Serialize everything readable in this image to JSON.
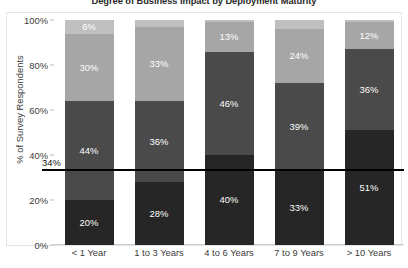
{
  "chart_data": {
    "type": "bar",
    "subtype": "stacked-bar-100",
    "title": "Degree of Business Impact by Deployment Maturity",
    "xlabel": "",
    "ylabel": "% of Survey Respondents",
    "ylim": [
      0,
      100
    ],
    "y_ticks": [
      "0%",
      "20%",
      "40%",
      "60%",
      "80%",
      "100%"
    ],
    "y_tick_values": [
      0,
      20,
      40,
      60,
      80,
      100
    ],
    "grid": false,
    "legend": "none",
    "categories": [
      "< 1 Year",
      "1 to 3 Years",
      "4 to 6 Years",
      "7 to 9 Years",
      "> 10 Years"
    ],
    "series": [
      {
        "name": "Level 1",
        "color": "#262626",
        "values": [
          20,
          28,
          40,
          33,
          51
        ],
        "labels": [
          "20%",
          "28%",
          "40%",
          "33%",
          "51%"
        ]
      },
      {
        "name": "Level 2",
        "color": "#4a4a4a",
        "values": [
          44,
          36,
          46,
          39,
          36
        ],
        "labels": [
          "44%",
          "36%",
          "46%",
          "39%",
          "36%"
        ]
      },
      {
        "name": "Level 3",
        "color": "#a6a6a6",
        "values": [
          30,
          33,
          13,
          24,
          12
        ],
        "labels": [
          "30%",
          "33%",
          "13%",
          "24%",
          "12%"
        ]
      },
      {
        "name": "Level 4",
        "color": "#bfbfbf",
        "values": [
          6,
          3,
          1,
          4,
          1
        ],
        "labels": [
          "6%",
          "",
          "",
          "",
          ""
        ]
      }
    ],
    "annotations": [
      {
        "type": "horizontal-reference-line",
        "value": 34,
        "label": "34%",
        "color": "#000000"
      }
    ]
  },
  "colors": {
    "segment_darkest": "#262626",
    "segment_dark": "#4a4a4a",
    "segment_light": "#a6a6a6",
    "segment_lightest": "#bfbfbf",
    "reference_line": "#000000",
    "axis_text": "#3b3b3b",
    "plot_background": "#ffffff",
    "frame_border": "#e3e3e3"
  }
}
